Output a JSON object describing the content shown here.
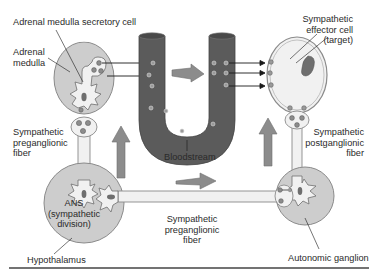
{
  "diagram": {
    "type": "physiology-pathway",
    "colors": {
      "organ_fill": "#cdcdcd",
      "organ_stroke": "#8a8a8a",
      "cell_fill": "#f1f1f1",
      "nucleus": "#6e6e6e",
      "bloodstream": "#5b5b5b",
      "big_arrow": "#8c8c8c",
      "line": "#1a1a1a",
      "rule": "#444444"
    },
    "labels": {
      "secretory_cell": "Adrenal medulla secretory cell",
      "adrenal_medulla": [
        "Adrenal",
        "medulla"
      ],
      "effector_cell": [
        "Sympathetic",
        "effector cell",
        "(target)"
      ],
      "preganglionic_left": [
        "Sympathetic",
        "preganglionic",
        "fiber"
      ],
      "bloodstream": "Bloodstream",
      "postganglionic": [
        "Sympathetic",
        "postganglionic",
        "fiber"
      ],
      "ans": [
        "ANS",
        "(sympathetic",
        "division)"
      ],
      "preganglionic_bottom": [
        "Sympathetic",
        "preganglionic",
        "fiber"
      ],
      "hypothalamus": "Hypothalamus",
      "autonomic_ganglion": "Autonomic ganglion"
    },
    "nodes": [
      {
        "id": "hypothalamus",
        "label": "Hypothalamus"
      },
      {
        "id": "ans",
        "label": "ANS (sympathetic division)"
      },
      {
        "id": "adrenal_medulla",
        "label": "Adrenal medulla"
      },
      {
        "id": "bloodstream",
        "label": "Bloodstream"
      },
      {
        "id": "autonomic_ganglion",
        "label": "Autonomic ganglion"
      },
      {
        "id": "effector_cell",
        "label": "Sympathetic effector cell (target)"
      }
    ],
    "edges": [
      {
        "from": "ans",
        "to": "adrenal_medulla",
        "via": "Sympathetic preganglionic fiber"
      },
      {
        "from": "adrenal_medulla",
        "to": "bloodstream",
        "via": "secretion"
      },
      {
        "from": "bloodstream",
        "to": "effector_cell",
        "via": "circulation"
      },
      {
        "from": "ans",
        "to": "autonomic_ganglion",
        "via": "Sympathetic preganglionic fiber"
      },
      {
        "from": "autonomic_ganglion",
        "to": "effector_cell",
        "via": "Sympathetic postganglionic fiber"
      }
    ]
  }
}
